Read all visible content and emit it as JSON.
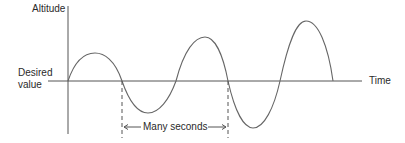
{
  "diagram": {
    "y_axis_label": "Altitude",
    "x_axis_label": "Time",
    "baseline_label_line1": "Desired",
    "baseline_label_line2": "value",
    "period_label": "Many seconds",
    "colors": {
      "line": "#555555",
      "text": "#2a2a2a",
      "background": "#ffffff"
    }
  }
}
